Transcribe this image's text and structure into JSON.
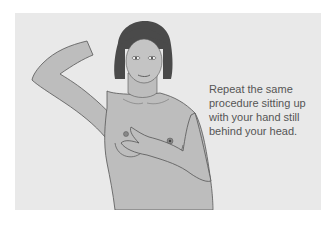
{
  "illustration": {
    "subject": "woman-self-exam-illustration",
    "caption": "Repeat the same procedure sitting up with your hand still behind your head."
  },
  "colors": {
    "background": "#ffffff",
    "panel": "#e9e9e9",
    "skin": "#bdbdbd",
    "hair": "#4a4a4a",
    "outline": "#555555",
    "text": "#555555"
  }
}
